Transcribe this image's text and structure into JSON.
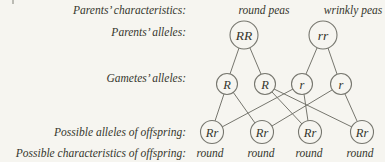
{
  "palette": {
    "background": "#f6f5f0",
    "line_color": "#76766e",
    "text_color": "#35352d"
  },
  "row_labels": {
    "parents_characteristics": "Parents’ characteristics:",
    "parents_alleles": "Parents’ alleles:",
    "gametes_alleles": "Gametes’ alleles:",
    "offspring_alleles": "Possible alleles of offspring:",
    "offspring_characteristics": "Possible characteristics of offspring:"
  },
  "parents": [
    {
      "characteristic": "round peas",
      "alleles": "RR"
    },
    {
      "characteristic": "wrinkly peas",
      "alleles": "rr"
    }
  ],
  "gametes": [
    {
      "allele": "R"
    },
    {
      "allele": "R"
    },
    {
      "allele": "r"
    },
    {
      "allele": "r"
    }
  ],
  "offspring": [
    {
      "alleles": "Rr",
      "characteristic": "round"
    },
    {
      "alleles": "Rr",
      "characteristic": "round"
    },
    {
      "alleles": "Rr",
      "characteristic": "round"
    },
    {
      "alleles": "Rr",
      "characteristic": "round"
    }
  ]
}
